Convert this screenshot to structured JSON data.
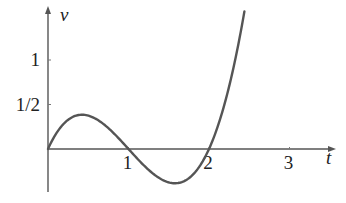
{
  "chart_data": {
    "type": "line",
    "title": "",
    "xlabel": "t",
    "ylabel": "v",
    "function": "v = t(t-1)(t-2)",
    "xlim": [
      0,
      3.5
    ],
    "ylim": [
      -0.5,
      1.6
    ],
    "x_ticks": [
      {
        "value": 1,
        "label": "1"
      },
      {
        "value": 2,
        "label": "2"
      },
      {
        "value": 3,
        "label": "3"
      }
    ],
    "y_ticks": [
      {
        "value": 0.5,
        "label": "1/2"
      },
      {
        "value": 1,
        "label": "1"
      }
    ],
    "grid": false,
    "legend": null,
    "series": [
      {
        "name": "v(t)",
        "color": "#555555",
        "x": [
          0,
          0.1,
          0.2,
          0.3,
          0.423,
          0.5,
          0.6,
          0.7,
          0.8,
          0.9,
          1.0,
          1.1,
          1.2,
          1.3,
          1.4,
          1.5,
          1.577,
          1.7,
          1.8,
          1.9,
          2.0,
          2.1,
          2.2,
          2.3,
          2.44
        ],
        "values": [
          0,
          0.171,
          0.288,
          0.357,
          0.385,
          0.375,
          0.336,
          0.273,
          0.192,
          0.099,
          0,
          -0.099,
          -0.192,
          -0.273,
          -0.336,
          -0.375,
          -0.385,
          -0.357,
          -0.288,
          -0.171,
          0,
          0.231,
          0.528,
          0.897,
          1.546
        ]
      }
    ]
  }
}
